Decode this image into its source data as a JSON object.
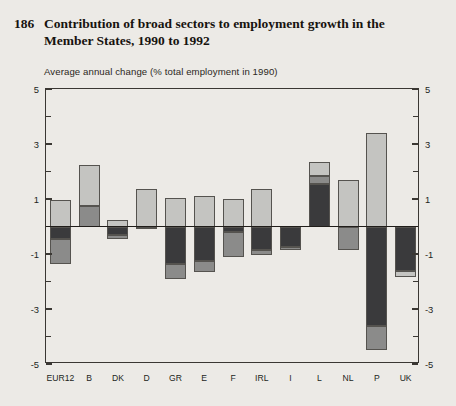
{
  "figure": {
    "number": "186",
    "title": "Contribution of broad sectors to employment growth in the Member States, 1990 to 1992",
    "subtitle": "Average annual change (% total employment in 1990)"
  },
  "legend": {
    "items": [
      {
        "key": "agriculture",
        "label": "Agriculture",
        "color": "#3a3a3c"
      },
      {
        "key": "industry",
        "label": "Industry",
        "color": "#8b8b8a"
      },
      {
        "key": "services",
        "label": "Services",
        "color": "#c4c4c1"
      }
    ]
  },
  "axis": {
    "y_major_labels": [
      "5",
      "3",
      "1",
      "-1",
      "-3",
      "-5"
    ],
    "y_major_values": [
      5,
      3,
      1,
      -1,
      -3,
      -5
    ],
    "y_minor_values": [
      4,
      2,
      0,
      -2,
      -4
    ],
    "ylim": [
      -5,
      5
    ]
  },
  "chart_data": {
    "type": "bar",
    "subtype": "stacked-diverging",
    "title": "Contribution of broad sectors to employment growth in the Member States, 1990 to 1992",
    "subtitle": "Average annual change (% total employment in 1990)",
    "xlabel": "",
    "ylabel": "Average annual change (% total employment in 1990)",
    "ylim": [
      -5,
      5
    ],
    "grid": false,
    "legend_position": "top-center",
    "categories": [
      "EUR12",
      "B",
      "DK",
      "D",
      "GR",
      "E",
      "F",
      "IRL",
      "I",
      "L",
      "NL",
      "P",
      "UK"
    ],
    "series": [
      {
        "name": "Agriculture",
        "color": "#3a3a3c",
        "values": [
          -0.45,
          0.0,
          -0.3,
          -0.1,
          -1.35,
          -1.25,
          -0.2,
          -0.85,
          -0.75,
          1.55,
          0.0,
          -3.6,
          -1.6
        ]
      },
      {
        "name": "Industry",
        "color": "#8b8b8a",
        "values": [
          -0.9,
          0.75,
          -0.15,
          0.0,
          -0.55,
          -0.4,
          -0.9,
          -0.2,
          -0.1,
          0.3,
          -0.85,
          -0.9,
          0.0
        ]
      },
      {
        "name": "Services",
        "color": "#c4c4c1",
        "values": [
          0.95,
          1.5,
          0.25,
          1.35,
          1.05,
          1.1,
          1.0,
          1.35,
          0.0,
          0.5,
          1.7,
          3.4,
          -0.25
        ]
      }
    ]
  },
  "bars": [
    {
      "cat": "EUR12",
      "pos": [
        {
          "s": "services",
          "v": 0.95
        }
      ],
      "neg": [
        {
          "s": "agriculture",
          "v": -0.45
        },
        {
          "s": "industry",
          "v": -0.9
        }
      ]
    },
    {
      "cat": "B",
      "pos": [
        {
          "s": "industry",
          "v": 0.75
        },
        {
          "s": "services",
          "v": 1.5
        }
      ],
      "neg": []
    },
    {
      "cat": "DK",
      "pos": [
        {
          "s": "services",
          "v": 0.25
        }
      ],
      "neg": [
        {
          "s": "agriculture",
          "v": -0.3
        },
        {
          "s": "industry",
          "v": -0.15
        }
      ]
    },
    {
      "cat": "D",
      "pos": [
        {
          "s": "services",
          "v": 1.35
        }
      ],
      "neg": [
        {
          "s": "agriculture",
          "v": -0.1
        }
      ]
    },
    {
      "cat": "GR",
      "pos": [
        {
          "s": "services",
          "v": 1.05
        }
      ],
      "neg": [
        {
          "s": "agriculture",
          "v": -1.35
        },
        {
          "s": "industry",
          "v": -0.55
        }
      ]
    },
    {
      "cat": "E",
      "pos": [
        {
          "s": "services",
          "v": 1.1
        }
      ],
      "neg": [
        {
          "s": "agriculture",
          "v": -1.25
        },
        {
          "s": "industry",
          "v": -0.4
        }
      ]
    },
    {
      "cat": "F",
      "pos": [
        {
          "s": "services",
          "v": 1.0
        }
      ],
      "neg": [
        {
          "s": "agriculture",
          "v": -0.2
        },
        {
          "s": "industry",
          "v": -0.9
        }
      ]
    },
    {
      "cat": "IRL",
      "pos": [
        {
          "s": "services",
          "v": 1.35
        }
      ],
      "neg": [
        {
          "s": "agriculture",
          "v": -0.85
        },
        {
          "s": "industry",
          "v": -0.2
        }
      ]
    },
    {
      "cat": "I",
      "pos": [],
      "neg": [
        {
          "s": "agriculture",
          "v": -0.75
        },
        {
          "s": "industry",
          "v": -0.1
        }
      ]
    },
    {
      "cat": "L",
      "pos": [
        {
          "s": "agriculture",
          "v": 1.55
        },
        {
          "s": "industry",
          "v": 0.3
        },
        {
          "s": "services",
          "v": 0.5
        }
      ],
      "neg": []
    },
    {
      "cat": "NL",
      "pos": [
        {
          "s": "services",
          "v": 1.7
        }
      ],
      "neg": [
        {
          "s": "industry",
          "v": -0.85
        }
      ]
    },
    {
      "cat": "P",
      "pos": [
        {
          "s": "services",
          "v": 3.4
        }
      ],
      "neg": [
        {
          "s": "agriculture",
          "v": -3.6
        },
        {
          "s": "industry",
          "v": -0.9
        }
      ]
    },
    {
      "cat": "UK",
      "pos": [],
      "neg": [
        {
          "s": "agriculture",
          "v": -1.6
        },
        {
          "s": "services",
          "v": -0.25
        }
      ]
    }
  ]
}
